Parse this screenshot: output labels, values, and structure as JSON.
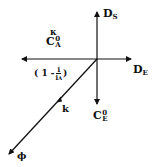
{
  "diagram": {
    "type": "vector-axes",
    "axes": {
      "up": {
        "main": "D",
        "sub": "S"
      },
      "right": {
        "main": "D",
        "sub": "E"
      },
      "down": {
        "main": "C",
        "sup": "0",
        "sub": "E"
      },
      "left_top_greek": "κ",
      "left": {
        "main": "C",
        "sup": "0",
        "sub": "A"
      },
      "left_expr": {
        "open": "( 1 -",
        "num": "i",
        "den_main": "i",
        "den_sub": "A",
        "close": ")"
      }
    },
    "diagonal": {
      "label": "k",
      "end_label": "ϕ"
    },
    "stroke_color": "#111111"
  }
}
